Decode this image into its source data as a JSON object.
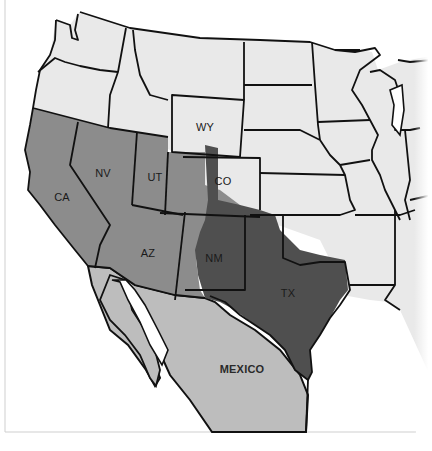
{
  "map": {
    "title": "",
    "colors": {
      "background": "#ffffff",
      "other_states": "#e9e9e9",
      "ceded_region": "#8c8c8c",
      "texas_annex": "#4f4f4f",
      "mexico": "#bdbdbd",
      "border": "#111111"
    },
    "labels": {
      "wy": "WY",
      "co": "CO",
      "ca": "CA",
      "nv": "NV",
      "ut": "UT",
      "az": "AZ",
      "nm": "NM",
      "tx": "TX",
      "mexico": "MEXICO"
    },
    "legend": []
  }
}
